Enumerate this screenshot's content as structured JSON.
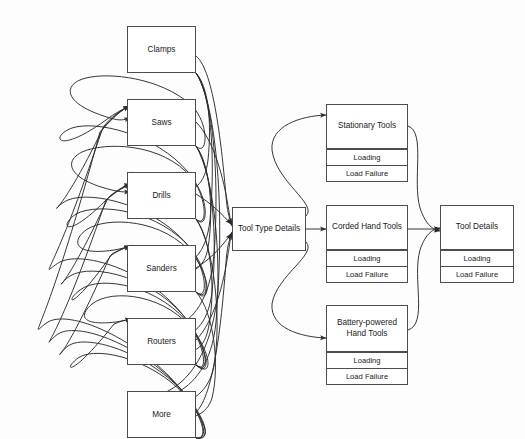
{
  "diagram": {
    "background_color": "#fdfdfd",
    "stroke_color": "#4d4d4d",
    "text_color": "#1a1a1a",
    "sub_label_loading": "Loading",
    "sub_label_load_failure": "Load Failure",
    "tool_types": [
      {
        "label": "Clamps"
      },
      {
        "label": "Saws"
      },
      {
        "label": "Drills"
      },
      {
        "label": "Sanders"
      },
      {
        "label": "Routers"
      },
      {
        "label": "More"
      }
    ],
    "hub": {
      "label": "Tool Type Details"
    },
    "categories": [
      {
        "label": "Stationary Tools",
        "loading": "Loading",
        "load_failure": "Load Failure"
      },
      {
        "label": "Corded Hand Tools",
        "loading": "Loading",
        "load_failure": "Load Failure"
      },
      {
        "label": "Battery-powered Hand Tools",
        "loading": "Loading",
        "load_failure": "Load Failure"
      }
    ],
    "detail": {
      "label": "Tool Details",
      "loading": "Loading",
      "load_failure": "Load Failure"
    }
  }
}
